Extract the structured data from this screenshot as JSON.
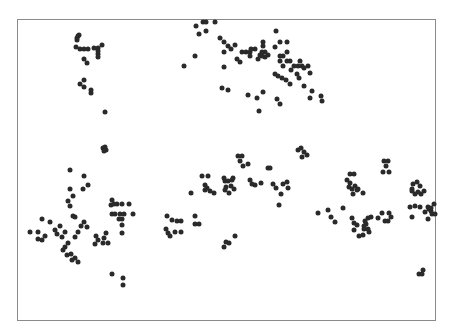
{
  "chart_data": {
    "type": "scatter",
    "title": "",
    "xlabel": "",
    "ylabel": "",
    "grid": false,
    "legend": null,
    "axes_visible": false,
    "frame": {
      "x": 17,
      "y": 19,
      "width": 419,
      "height": 302,
      "color": "#8a8a8a"
    },
    "marker_color": "#2a2a2a",
    "coordinate_space": "screenshot pixels (origin top-left)",
    "points": [
      [
        78,
        36
      ],
      [
        79,
        35
      ],
      [
        77,
        38
      ],
      [
        77,
        40
      ],
      [
        76,
        47
      ],
      [
        80,
        49
      ],
      [
        84,
        49
      ],
      [
        88,
        49
      ],
      [
        94,
        48
      ],
      [
        98,
        48
      ],
      [
        102,
        45
      ],
      [
        98,
        51
      ],
      [
        98,
        54
      ],
      [
        98,
        57
      ],
      [
        84,
        59
      ],
      [
        87,
        63
      ],
      [
        84,
        80
      ],
      [
        80,
        84
      ],
      [
        84,
        87
      ],
      [
        91,
        90
      ],
      [
        91,
        93
      ],
      [
        105,
        112
      ],
      [
        103,
        148
      ],
      [
        105,
        147
      ],
      [
        106,
        150
      ],
      [
        104,
        151
      ],
      [
        203,
        22
      ],
      [
        206,
        22
      ],
      [
        215,
        22
      ],
      [
        199,
        34
      ],
      [
        206,
        31
      ],
      [
        196,
        26
      ],
      [
        184,
        66
      ],
      [
        195,
        56
      ],
      [
        220,
        38
      ],
      [
        224,
        42
      ],
      [
        224,
        52
      ],
      [
        228,
        46
      ],
      [
        224,
        67
      ],
      [
        222,
        88
      ],
      [
        228,
        90
      ],
      [
        231,
        49
      ],
      [
        235,
        45
      ],
      [
        237,
        59
      ],
      [
        240,
        62
      ],
      [
        242,
        52
      ],
      [
        246,
        52
      ],
      [
        250,
        52
      ],
      [
        250,
        56
      ],
      [
        251,
        49
      ],
      [
        255,
        49
      ],
      [
        258,
        59
      ],
      [
        262,
        56
      ],
      [
        262,
        52
      ],
      [
        265,
        52
      ],
      [
        263,
        42
      ],
      [
        263,
        46
      ],
      [
        260,
        55
      ],
      [
        265,
        57
      ],
      [
        268,
        55
      ],
      [
        248,
        95
      ],
      [
        257,
        98
      ],
      [
        259,
        111
      ],
      [
        263,
        92
      ],
      [
        276,
        31
      ],
      [
        280,
        42
      ],
      [
        275,
        47
      ],
      [
        287,
        42
      ],
      [
        283,
        56
      ],
      [
        280,
        56
      ],
      [
        283,
        66
      ],
      [
        287,
        52
      ],
      [
        280,
        61
      ],
      [
        287,
        61
      ],
      [
        290,
        61
      ],
      [
        291,
        70
      ],
      [
        275,
        74
      ],
      [
        278,
        76
      ],
      [
        282,
        78
      ],
      [
        286,
        80
      ],
      [
        290,
        84
      ],
      [
        294,
        66
      ],
      [
        298,
        66
      ],
      [
        302,
        66
      ],
      [
        300,
        61
      ],
      [
        304,
        68
      ],
      [
        308,
        66
      ],
      [
        310,
        73
      ],
      [
        297,
        74
      ],
      [
        299,
        78
      ],
      [
        304,
        86
      ],
      [
        312,
        91
      ],
      [
        321,
        96
      ],
      [
        322,
        101
      ],
      [
        310,
        98
      ],
      [
        277,
        99
      ],
      [
        280,
        104
      ],
      [
        70,
        170
      ],
      [
        84,
        176
      ],
      [
        88,
        185
      ],
      [
        83,
        189
      ],
      [
        70,
        189
      ],
      [
        68,
        201
      ],
      [
        73,
        196
      ],
      [
        70,
        206
      ],
      [
        73,
        216
      ],
      [
        75,
        217
      ],
      [
        60,
        226
      ],
      [
        50,
        222
      ],
      [
        42,
        219
      ],
      [
        38,
        232
      ],
      [
        45,
        236
      ],
      [
        42,
        240
      ],
      [
        38,
        239
      ],
      [
        30,
        232
      ],
      [
        55,
        230
      ],
      [
        57,
        234
      ],
      [
        62,
        237
      ],
      [
        65,
        232
      ],
      [
        68,
        243
      ],
      [
        65,
        247
      ],
      [
        63,
        250
      ],
      [
        67,
        255
      ],
      [
        71,
        254
      ],
      [
        75,
        258
      ],
      [
        78,
        262
      ],
      [
        72,
        260
      ],
      [
        75,
        237
      ],
      [
        78,
        232
      ],
      [
        81,
        226
      ],
      [
        84,
        222
      ],
      [
        87,
        227
      ],
      [
        96,
        236
      ],
      [
        95,
        244
      ],
      [
        98,
        240
      ],
      [
        103,
        243
      ],
      [
        108,
        243
      ],
      [
        104,
        238
      ],
      [
        106,
        233
      ],
      [
        111,
        205
      ],
      [
        112,
        200
      ],
      [
        114,
        204
      ],
      [
        117,
        204
      ],
      [
        122,
        204
      ],
      [
        129,
        204
      ],
      [
        112,
        214
      ],
      [
        115,
        214
      ],
      [
        120,
        214
      ],
      [
        124,
        214
      ],
      [
        119,
        219
      ],
      [
        122,
        219
      ],
      [
        122,
        225
      ],
      [
        133,
        214
      ],
      [
        122,
        233
      ],
      [
        112,
        274
      ],
      [
        123,
        278
      ],
      [
        123,
        285
      ],
      [
        167,
        216
      ],
      [
        172,
        220
      ],
      [
        177,
        221
      ],
      [
        181,
        221
      ],
      [
        166,
        229
      ],
      [
        168,
        233
      ],
      [
        170,
        236
      ],
      [
        175,
        232
      ],
      [
        181,
        232
      ],
      [
        195,
        216
      ],
      [
        195,
        224
      ],
      [
        199,
        224
      ],
      [
        191,
        193
      ],
      [
        202,
        176
      ],
      [
        208,
        176
      ],
      [
        205,
        185
      ],
      [
        207,
        188
      ],
      [
        210,
        191
      ],
      [
        214,
        193
      ],
      [
        205,
        190
      ],
      [
        224,
        178
      ],
      [
        225,
        181
      ],
      [
        228,
        181
      ],
      [
        232,
        180
      ],
      [
        233,
        178
      ],
      [
        231,
        186
      ],
      [
        226,
        187
      ],
      [
        225,
        190
      ],
      [
        234,
        189
      ],
      [
        229,
        193
      ],
      [
        235,
        236
      ],
      [
        226,
        242
      ],
      [
        229,
        243
      ],
      [
        224,
        247
      ],
      [
        238,
        156
      ],
      [
        240,
        161
      ],
      [
        242,
        156
      ],
      [
        248,
        164
      ],
      [
        243,
        166
      ],
      [
        250,
        180
      ],
      [
        252,
        184
      ],
      [
        255,
        185
      ],
      [
        261,
        183
      ],
      [
        268,
        168
      ],
      [
        273,
        184
      ],
      [
        276,
        188
      ],
      [
        283,
        184
      ],
      [
        287,
        182
      ],
      [
        288,
        188
      ],
      [
        281,
        194
      ],
      [
        279,
        205
      ],
      [
        270,
        168
      ],
      [
        298,
        150
      ],
      [
        301,
        148
      ],
      [
        304,
        152
      ],
      [
        307,
        155
      ],
      [
        302,
        157
      ],
      [
        318,
        213
      ],
      [
        328,
        210
      ],
      [
        331,
        217
      ],
      [
        335,
        222
      ],
      [
        343,
        208
      ],
      [
        350,
        174
      ],
      [
        354,
        174
      ],
      [
        347,
        180
      ],
      [
        350,
        183
      ],
      [
        349,
        187
      ],
      [
        352,
        189
      ],
      [
        353,
        194
      ],
      [
        355,
        186
      ],
      [
        357,
        190
      ],
      [
        358,
        189
      ],
      [
        363,
        193
      ],
      [
        352,
        218
      ],
      [
        354,
        223
      ],
      [
        357,
        225
      ],
      [
        354,
        230
      ],
      [
        359,
        236
      ],
      [
        363,
        235
      ],
      [
        365,
        221
      ],
      [
        366,
        224
      ],
      [
        368,
        218
      ],
      [
        368,
        229
      ],
      [
        369,
        232
      ],
      [
        364,
        229
      ],
      [
        364,
        226
      ],
      [
        371,
        217
      ],
      [
        378,
        218
      ],
      [
        382,
        213
      ],
      [
        385,
        221
      ],
      [
        388,
        221
      ],
      [
        391,
        217
      ],
      [
        389,
        213
      ],
      [
        384,
        161
      ],
      [
        388,
        161
      ],
      [
        386,
        166
      ],
      [
        383,
        172
      ],
      [
        389,
        172
      ],
      [
        412,
        189
      ],
      [
        413,
        184
      ],
      [
        417,
        182
      ],
      [
        412,
        191
      ],
      [
        418,
        192
      ],
      [
        420,
        186
      ],
      [
        424,
        191
      ],
      [
        421,
        194
      ],
      [
        415,
        194
      ],
      [
        410,
        207
      ],
      [
        415,
        206
      ],
      [
        420,
        207
      ],
      [
        428,
        207
      ],
      [
        429,
        209
      ],
      [
        431,
        211
      ],
      [
        432,
        214
      ],
      [
        435,
        214
      ],
      [
        431,
        208
      ],
      [
        434,
        204
      ],
      [
        425,
        212
      ],
      [
        412,
        217
      ],
      [
        428,
        219
      ],
      [
        423,
        270
      ],
      [
        422,
        274
      ],
      [
        419,
        274
      ]
    ]
  }
}
